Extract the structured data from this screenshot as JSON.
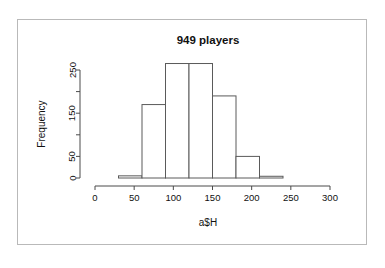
{
  "chart_data": {
    "type": "bar",
    "subtype": "histogram",
    "title": "949 players",
    "xlabel": "a$H",
    "ylabel": "Frequency",
    "grid": false,
    "legend": null,
    "xlim": [
      0,
      300
    ],
    "ylim": [
      0,
      275
    ],
    "bin_width": 30,
    "bin_edges": [
      30,
      60,
      90,
      120,
      150,
      180,
      210,
      240
    ],
    "categories": [
      "30-60",
      "60-90",
      "90-120",
      "120-150",
      "150-180",
      "180-210",
      "210-240"
    ],
    "values": [
      5,
      170,
      265,
      265,
      190,
      50,
      4
    ],
    "total_count": 949,
    "xticks": [
      0,
      50,
      100,
      150,
      200,
      250,
      300
    ],
    "xticklabels": [
      "0",
      "50",
      "100",
      "150",
      "200",
      "250",
      "300"
    ],
    "yticks": [
      0,
      50,
      100,
      150,
      200,
      250
    ],
    "yticklabels": [
      "0",
      "50",
      "",
      "150",
      "",
      "250"
    ],
    "bar_fill": "#ffffff",
    "bar_stroke": "#5a5a5a",
    "axis_color": "#4a4a4a",
    "text_color": "#111111"
  },
  "figure": {
    "border_color": "#b9b9b9",
    "background": "#ffffff"
  }
}
